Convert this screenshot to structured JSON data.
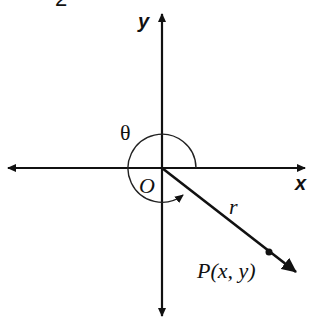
{
  "figure_number": "2",
  "axes": {
    "x_label": "x",
    "y_label": "y",
    "origin_label": "O"
  },
  "angle": {
    "label": "θ",
    "description": "angle measured counterclockwise from positive x-axis to terminal ray"
  },
  "ray": {
    "length_label": "r",
    "point_label": "P(x, y)",
    "direction": "fourth quadrant"
  },
  "colors": {
    "stroke": "#111111",
    "background": "#ffffff"
  }
}
